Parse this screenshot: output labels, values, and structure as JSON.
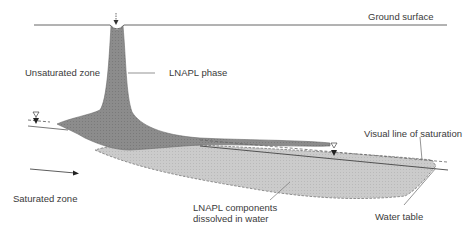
{
  "diagram": {
    "labels": {
      "ground_surface": "Ground surface",
      "unsaturated_zone": "Unsaturated zone",
      "lnapl_phase": "LNAPL phase",
      "visual_line_of_saturation": "Visual line of saturation",
      "saturated_zone": "Saturated zone",
      "dissolved_line1": "LNAPL components",
      "dissolved_line2": "dissolved in water",
      "water_table": "Water table"
    },
    "colors": {
      "lnapl_phase_fill": "#8a8a8a",
      "dissolved_fill": "#c8c8c8",
      "line": "#555555",
      "background": "#ffffff"
    },
    "symbols": {
      "water_table_marker": "▽",
      "flow_direction": "arrow-right"
    }
  }
}
